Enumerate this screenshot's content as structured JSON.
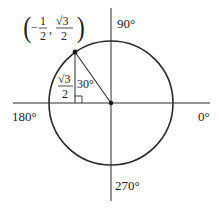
{
  "diagram": {
    "colors": {
      "stroke": "#2a2a2a",
      "text": "#222222",
      "background": "#ffffff"
    },
    "axis_labels": {
      "right": "0°",
      "top": "90°",
      "left": "180°",
      "bottom": "270°"
    },
    "point": {
      "label_open": "(",
      "label_close": ")",
      "x_sign": "−",
      "x_num": "1",
      "x_den": "2",
      "comma": ",",
      "y_num": "√3",
      "y_den": "2"
    },
    "triangle": {
      "angle_label": "30°",
      "side_num": "√3",
      "side_den": "2",
      "right_angle_marker": true
    }
  }
}
